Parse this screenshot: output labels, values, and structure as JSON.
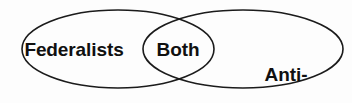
{
  "diagram": {
    "type": "venn",
    "title": "",
    "background_color": "#fdfdfd",
    "stroke_color": "#1b1b1b",
    "text_color": "#101010",
    "sets": [
      {
        "id": "left",
        "label": "Federalists",
        "position": "left-ellipse",
        "center": [
          118,
          49
        ],
        "rx": 96,
        "ry": 39
      },
      {
        "id": "right",
        "label_line1": "Anti-",
        "label_line2": "federalists",
        "label": "Anti-federalists",
        "position": "right-ellipse",
        "center": [
          243,
          49
        ],
        "rx": 100,
        "ry": 39
      }
    ],
    "intersection": {
      "id": "both",
      "label": "Both",
      "position": "overlap-lens",
      "crossings": [
        [
          178,
          13
        ],
        [
          178,
          85
        ]
      ]
    }
  }
}
